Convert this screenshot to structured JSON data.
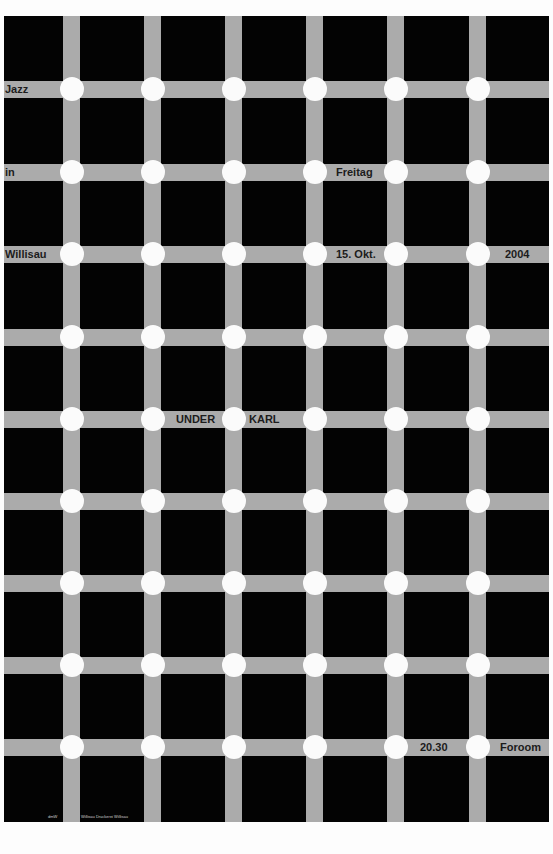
{
  "poster": {
    "colors": {
      "background": "#030303",
      "grid": "#ababab",
      "dot": "#fbfbfb",
      "text": "#1c1c1c",
      "paper": "#fdfdfd"
    },
    "grid": {
      "columns_x": [
        72,
        153,
        234,
        315,
        396,
        478
      ],
      "rows_y": [
        89,
        172,
        254,
        337,
        419,
        501,
        583,
        665,
        747
      ]
    },
    "labels": {
      "jazz": "Jazz",
      "in": "in",
      "willisau": "Willisau",
      "freitag": "Freitag",
      "date": "15. Okt.",
      "year": "2004",
      "artist_first": "UNDER",
      "artist_second": "KARL",
      "time": "20.30",
      "venue": "Foroom"
    },
    "fine_print": {
      "left": "dmW",
      "right": "Willisau Druckerei Willisau"
    }
  }
}
